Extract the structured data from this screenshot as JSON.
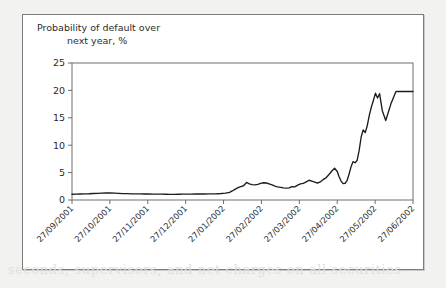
{
  "figure": {
    "title_line1": "Probability of default over",
    "title_line2": "next year, %",
    "frame_color": "#7c7c7c",
    "line_color": "#1c1c1c",
    "background": "#ffffff"
  },
  "bleed_text": "seconds, supervisors, and net charges on all securities",
  "chart_data": {
    "type": "line",
    "title": "Probability of default over next year, %",
    "xlabel": "",
    "ylabel": "",
    "ylim": [
      0,
      25
    ],
    "yticks": [
      0,
      5,
      10,
      15,
      20,
      25
    ],
    "grid": false,
    "legend": null,
    "xtick_labels": [
      "27/09/2001",
      "27/10/2001",
      "27/11/2001",
      "27/12/2001",
      "27/01/2002",
      "27/02/2002",
      "27/03/2002",
      "27/04/2002",
      "27/05/2002",
      "27/06/2002"
    ],
    "x_axis_start": "27/09/2001",
    "x_axis_end": "27/06/2002",
    "series": [
      {
        "name": "Probability of default over next year",
        "x_fraction": [
          0.0,
          0.012,
          0.025,
          0.037,
          0.05,
          0.062,
          0.075,
          0.087,
          0.1,
          0.112,
          0.125,
          0.137,
          0.15,
          0.162,
          0.175,
          0.187,
          0.2,
          0.212,
          0.225,
          0.237,
          0.25,
          0.262,
          0.275,
          0.287,
          0.3,
          0.312,
          0.325,
          0.337,
          0.35,
          0.362,
          0.375,
          0.387,
          0.4,
          0.412,
          0.425,
          0.437,
          0.45,
          0.462,
          0.47,
          0.478,
          0.487,
          0.495,
          0.503,
          0.512,
          0.52,
          0.528,
          0.537,
          0.545,
          0.553,
          0.562,
          0.57,
          0.578,
          0.587,
          0.595,
          0.603,
          0.612,
          0.62,
          0.628,
          0.637,
          0.645,
          0.653,
          0.662,
          0.67,
          0.678,
          0.687,
          0.695,
          0.703,
          0.712,
          0.72,
          0.728,
          0.737,
          0.745,
          0.753,
          0.762,
          0.77,
          0.778,
          0.783,
          0.789,
          0.795,
          0.801,
          0.807,
          0.812,
          0.818,
          0.824,
          0.83,
          0.836,
          0.842,
          0.848,
          0.854,
          0.86,
          0.866,
          0.872,
          0.878,
          0.884,
          0.89,
          0.896,
          0.902,
          0.91,
          0.92,
          0.935,
          0.95,
          0.97,
          1.0
        ],
        "values": [
          1.05,
          1.08,
          1.1,
          1.12,
          1.14,
          1.18,
          1.22,
          1.26,
          1.3,
          1.28,
          1.24,
          1.2,
          1.17,
          1.15,
          1.13,
          1.12,
          1.11,
          1.1,
          1.09,
          1.08,
          1.07,
          1.06,
          1.05,
          1.04,
          1.04,
          1.05,
          1.06,
          1.07,
          1.08,
          1.09,
          1.1,
          1.1,
          1.11,
          1.12,
          1.14,
          1.18,
          1.25,
          1.4,
          1.65,
          1.95,
          2.25,
          2.45,
          2.6,
          3.2,
          2.95,
          2.8,
          2.75,
          2.85,
          3.05,
          3.15,
          3.1,
          2.95,
          2.75,
          2.55,
          2.4,
          2.3,
          2.22,
          2.18,
          2.2,
          2.45,
          2.4,
          2.7,
          2.95,
          3.05,
          3.3,
          3.6,
          3.45,
          3.25,
          3.1,
          3.3,
          3.75,
          4.05,
          4.6,
          5.3,
          5.8,
          5.2,
          4.3,
          3.45,
          3.0,
          3.05,
          3.6,
          4.6,
          6.0,
          7.0,
          6.8,
          7.2,
          9.0,
          11.5,
          12.8,
          12.3,
          13.6,
          15.5,
          17.0,
          18.2,
          19.5,
          18.6,
          19.4,
          16.3,
          14.5,
          17.5,
          19.8,
          19.8,
          19.8
        ]
      }
    ],
    "annotations": {
      "plateau_level": 19.8,
      "plateau_start": "early 27/05/2002",
      "initial_level": 1.05,
      "max_value": 19.8
    }
  }
}
